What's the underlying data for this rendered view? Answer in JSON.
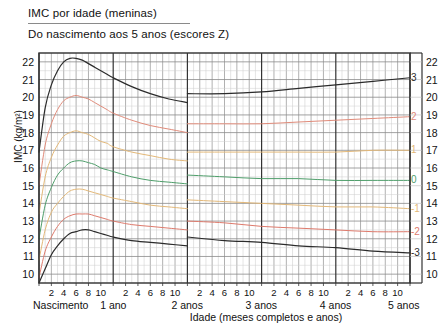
{
  "title": "IMC por idade (meninas)",
  "subtitle": "Do nascimento aos 5 anos (escores Z)",
  "axis": {
    "ylabel": "IMC (kg/m²)",
    "xlabel": "Idade (meses completos e anos)",
    "birth_label": "Nascimento"
  },
  "chart_data": {
    "type": "line",
    "title": "IMC por idade (meninas)",
    "subtitle": "Do nascimento aos 5 anos (escores Z)",
    "xlabel": "Idade (meses completos e anos)",
    "ylabel": "IMC (kg/m²)",
    "xlim": [
      0,
      60
    ],
    "ylim": [
      9.5,
      22.5
    ],
    "grid": true,
    "legend_position": "right-inline",
    "x_unit": "months",
    "x_major_ticks": [
      0,
      12,
      24,
      36,
      48,
      60
    ],
    "x_year_labels": [
      "Nascimento",
      "1 ano",
      "2 anos",
      "3 anos",
      "4 anos",
      "5 anos"
    ],
    "x_month_ticks": [
      2,
      4,
      6,
      8,
      10
    ],
    "y_ticks": [
      10,
      11,
      12,
      13,
      14,
      15,
      16,
      17,
      18,
      19,
      20,
      21,
      22
    ],
    "y_right_ticks": [
      10,
      11,
      12,
      13,
      14,
      15,
      16,
      17,
      18,
      19,
      20,
      21,
      22
    ],
    "discontinuity_at_months": 24,
    "series": [
      {
        "name": "3",
        "label": "3",
        "color": "#2b2b2b",
        "x": [
          0,
          1,
          2,
          3,
          4,
          5,
          6,
          7,
          8,
          9,
          10,
          11,
          12,
          15,
          18,
          21,
          24,
          24,
          30,
          36,
          42,
          48,
          54,
          60
        ],
        "values": [
          16.9,
          19.4,
          20.7,
          21.5,
          22.0,
          22.2,
          22.2,
          22.1,
          21.9,
          21.7,
          21.5,
          21.3,
          21.1,
          20.6,
          20.2,
          19.9,
          19.7,
          20.2,
          20.2,
          20.3,
          20.5,
          20.7,
          20.9,
          21.1
        ]
      },
      {
        "name": "2",
        "label": "2",
        "color": "#e08b7a",
        "x": [
          0,
          1,
          2,
          3,
          4,
          5,
          6,
          7,
          8,
          9,
          10,
          11,
          12,
          15,
          18,
          21,
          24,
          24,
          30,
          36,
          42,
          48,
          54,
          60
        ],
        "values": [
          15.0,
          17.3,
          18.5,
          19.3,
          19.8,
          20.0,
          20.1,
          20.0,
          19.9,
          19.7,
          19.5,
          19.3,
          19.1,
          18.7,
          18.4,
          18.2,
          18.0,
          18.5,
          18.5,
          18.5,
          18.6,
          18.7,
          18.8,
          18.9
        ]
      },
      {
        "name": "1",
        "label": "1",
        "color": "#e3b878",
        "x": [
          0,
          1,
          2,
          3,
          4,
          5,
          6,
          7,
          8,
          9,
          10,
          11,
          12,
          15,
          18,
          21,
          24,
          24,
          30,
          36,
          42,
          48,
          54,
          60
        ],
        "values": [
          13.4,
          15.5,
          16.6,
          17.3,
          17.8,
          18.0,
          18.1,
          18.0,
          17.9,
          17.7,
          17.5,
          17.4,
          17.2,
          16.9,
          16.7,
          16.5,
          16.4,
          16.9,
          16.9,
          16.9,
          16.9,
          16.9,
          17.0,
          17.0
        ]
      },
      {
        "name": "0",
        "label": "0",
        "color": "#4e9e6a",
        "x": [
          0,
          1,
          2,
          3,
          4,
          5,
          6,
          7,
          8,
          9,
          10,
          11,
          12,
          15,
          18,
          21,
          24,
          24,
          30,
          36,
          42,
          48,
          54,
          60
        ],
        "values": [
          12.0,
          13.9,
          14.9,
          15.6,
          16.0,
          16.3,
          16.4,
          16.4,
          16.3,
          16.2,
          16.0,
          15.9,
          15.8,
          15.5,
          15.3,
          15.2,
          15.1,
          15.6,
          15.5,
          15.4,
          15.4,
          15.3,
          15.3,
          15.3
        ]
      },
      {
        "name": "-1",
        "label": "-1",
        "color": "#e3b878",
        "x": [
          0,
          1,
          2,
          3,
          4,
          5,
          6,
          7,
          8,
          9,
          10,
          11,
          12,
          15,
          18,
          21,
          24,
          24,
          30,
          36,
          42,
          48,
          54,
          60
        ],
        "values": [
          10.8,
          12.5,
          13.5,
          14.0,
          14.4,
          14.7,
          14.8,
          14.8,
          14.7,
          14.6,
          14.5,
          14.4,
          14.3,
          14.1,
          13.9,
          13.8,
          13.7,
          14.2,
          14.1,
          14.0,
          13.9,
          13.8,
          13.8,
          13.7
        ]
      },
      {
        "name": "-2",
        "label": "-2",
        "color": "#de7a6c",
        "x": [
          0,
          1,
          2,
          3,
          4,
          5,
          6,
          7,
          8,
          9,
          10,
          11,
          12,
          15,
          18,
          21,
          24,
          24,
          30,
          36,
          42,
          48,
          54,
          60
        ],
        "values": [
          9.8,
          11.3,
          12.1,
          12.7,
          13.1,
          13.3,
          13.4,
          13.4,
          13.4,
          13.3,
          13.2,
          13.1,
          13.0,
          12.8,
          12.7,
          12.6,
          12.5,
          13.0,
          12.9,
          12.7,
          12.6,
          12.5,
          12.4,
          12.4
        ]
      },
      {
        "name": "-3",
        "label": "-3",
        "color": "#2b2b2b",
        "x": [
          0,
          1,
          2,
          3,
          4,
          5,
          6,
          7,
          8,
          9,
          10,
          11,
          12,
          15,
          18,
          21,
          24,
          24,
          30,
          36,
          42,
          48,
          54,
          60
        ],
        "values": [
          9.5,
          10.3,
          11.1,
          11.6,
          12.0,
          12.3,
          12.4,
          12.5,
          12.5,
          12.4,
          12.3,
          12.2,
          12.1,
          11.9,
          11.8,
          11.7,
          11.6,
          12.1,
          11.9,
          11.8,
          11.6,
          11.5,
          11.3,
          11.2
        ]
      }
    ]
  }
}
